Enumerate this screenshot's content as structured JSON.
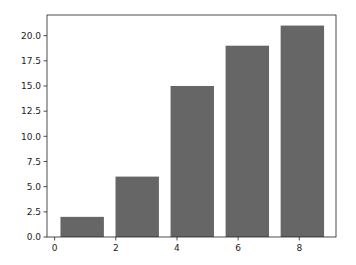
{
  "chart_data": {
    "type": "bar",
    "title": "",
    "xlabel": "",
    "ylabel": "",
    "x": [
      0.9,
      2.7,
      4.5,
      6.3,
      8.1
    ],
    "values": [
      2,
      6,
      15,
      19,
      21
    ],
    "bar_width": 1.42,
    "bar_color": "#666666",
    "xlim": [
      -0.25,
      9.2
    ],
    "ylim": [
      0,
      22.05
    ],
    "xticks": [
      0,
      2,
      4,
      6,
      8
    ],
    "xtick_labels": [
      "0",
      "2",
      "4",
      "6",
      "8"
    ],
    "yticks": [
      0,
      2.5,
      5,
      7.5,
      10,
      12.5,
      15,
      17.5,
      20
    ],
    "ytick_labels": [
      "0.0",
      "2.5",
      "5.0",
      "7.5",
      "10.0",
      "12.5",
      "15.0",
      "17.5",
      "20.0"
    ],
    "grid": false,
    "legend": null
  }
}
